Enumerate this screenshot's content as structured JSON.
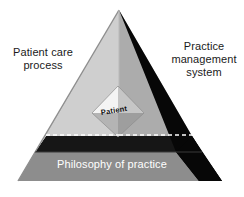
{
  "figure": {
    "type": "3d-pyramid-diagram",
    "background_color": "#ffffff"
  },
  "labels": {
    "left_face": "Patient care\nprocess",
    "right_face": "Practice\nmanagement\nsystem",
    "base_band": "Philosophy of practice",
    "core": "Patient"
  },
  "colors": {
    "left_face": "#c9c9c9",
    "left_face_inner": "#d6d6d6",
    "right_face": "#a9a9a9",
    "right_shadow_face": "#080808",
    "dark_band": "#151515",
    "base_band": "#8f8f8f",
    "base_band_right": "#7a7a7a",
    "core_top_left": "#f2f2f2",
    "core_top_right": "#c2c2c2",
    "core_bottom_left": "#b5b5b5",
    "core_bottom_right": "#9a9a9a",
    "dashed_line": "#ffffff",
    "edge_line": "#7d7d7d",
    "text_dark": "#1a1a1a",
    "text_light": "#ffffff"
  },
  "geometry": {
    "apex": [
      119,
      10
    ],
    "base_left": [
      18,
      181
    ],
    "base_right": [
      222,
      181
    ],
    "band_top_y": 135,
    "band_bottom_y": 152,
    "base_bottom_y": 181,
    "core_center": [
      118,
      111
    ]
  }
}
